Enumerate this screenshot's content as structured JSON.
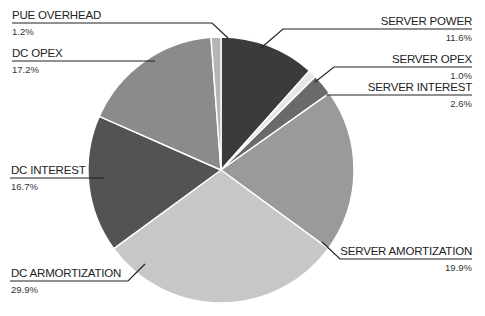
{
  "chart_data": {
    "type": "pie",
    "title": "",
    "start_angle_deg": 0,
    "direction": "clockwise",
    "slices": [
      {
        "label": "SERVER POWER",
        "value": 11.6,
        "display": "11.6%",
        "color": "#3b3b3b"
      },
      {
        "label": "SERVER OPEX",
        "value": 1.0,
        "display": "1.0%",
        "color": "#e6e6e6"
      },
      {
        "label": "SERVER INTEREST",
        "value": 2.6,
        "display": "2.6%",
        "color": "#6a6a6a"
      },
      {
        "label": "SERVER AMORTIZATION",
        "value": 19.9,
        "display": "19.9%",
        "color": "#9a9a9a"
      },
      {
        "label": "DC ARMORTIZATION",
        "value": 29.9,
        "display": "29.9%",
        "color": "#c7c7c7"
      },
      {
        "label": "DC INTEREST",
        "value": 16.7,
        "display": "16.7%",
        "color": "#535353"
      },
      {
        "label": "DC OPEX",
        "value": 17.2,
        "display": "17.2%",
        "color": "#8b8b8b"
      },
      {
        "label": "PUE OVERHEAD",
        "value": 1.2,
        "display": "1.2%",
        "color": "#b5b5b5"
      }
    ],
    "legend": "leader-line labels"
  },
  "labels": {
    "pue_overhead": {
      "name": "PUE OVERHEAD",
      "pct": "1.2%"
    },
    "dc_opex": {
      "name": "DC OPEX",
      "pct": "17.2%"
    },
    "dc_interest": {
      "name": "DC INTEREST",
      "pct": "16.7%"
    },
    "dc_armortization": {
      "name": "DC ARMORTIZATION",
      "pct": "29.9%"
    },
    "server_power": {
      "name": "SERVER POWER",
      "pct": "11.6%"
    },
    "server_opex": {
      "name": "SERVER OPEX",
      "pct": "1.0%"
    },
    "server_interest": {
      "name": "SERVER INTEREST",
      "pct": "2.6%"
    },
    "server_amortization": {
      "name": "SERVER AMORTIZATION",
      "pct": "19.9%"
    }
  }
}
